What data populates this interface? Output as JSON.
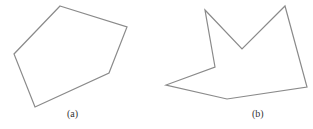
{
  "figures": [
    {
      "id": "a",
      "caption": "(a)",
      "description": "convex pentagon",
      "points": "60,6 127,27 109,73 35,107 14,54",
      "caption_pos": {
        "x": 67,
        "y": 109
      }
    },
    {
      "id": "b",
      "caption": "(b)",
      "description": "concave (non-convex) heptagon",
      "points": "205,10 242,49 285,6 307,87 227,99 166,85 215,67",
      "caption_pos": {
        "x": 252,
        "y": 109
      }
    }
  ],
  "style": {
    "stroke": "#8a8a8a",
    "stroke_width": 1.2,
    "fill": "none"
  }
}
